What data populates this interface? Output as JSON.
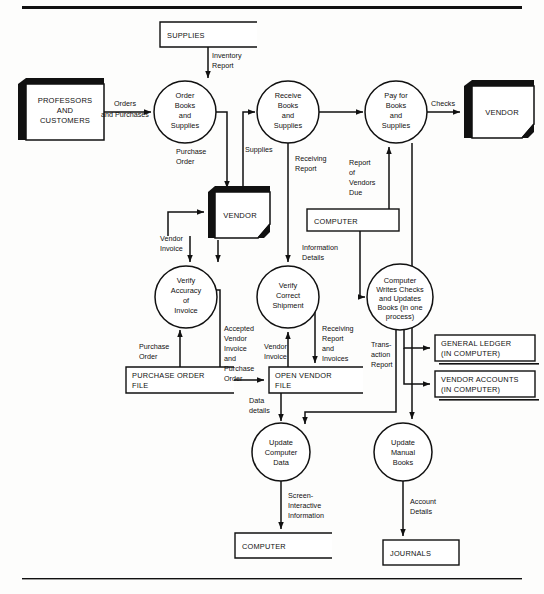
{
  "diagram": {
    "type": "data-flow-diagram",
    "colors": {
      "ink": "#111111",
      "paper": "#fdfdfc",
      "shadow": "#000000"
    },
    "rules": {
      "top": "horizontal-rule",
      "bottom": "horizontal-rule"
    },
    "entities": [
      {
        "id": "professors",
        "label_lines": [
          "PROFESSORS",
          "AND",
          "CUSTOMERS"
        ],
        "x": 18,
        "y": 84,
        "w": 78,
        "h": 56
      },
      {
        "id": "vendor_right",
        "label_lines": [
          "VENDOR"
        ],
        "x": 464,
        "y": 86,
        "w": 64,
        "h": 52
      },
      {
        "id": "vendor_mid",
        "label_lines": [
          "VENDOR"
        ],
        "x": 208,
        "y": 192,
        "w": 56,
        "h": 46
      }
    ],
    "processes": [
      {
        "id": "p1",
        "label_lines": [
          "Order",
          "Books",
          "and",
          "Supplies"
        ],
        "cx": 185,
        "cy": 112,
        "r": 31
      },
      {
        "id": "p2",
        "label_lines": [
          "Receive",
          "Books",
          "and",
          "Supplies"
        ],
        "cx": 288,
        "cy": 112,
        "r": 31
      },
      {
        "id": "p3",
        "label_lines": [
          "Pay for",
          "Books",
          "and",
          "Supplies"
        ],
        "cx": 396,
        "cy": 112,
        "r": 31
      },
      {
        "id": "p4",
        "label_lines": [
          "Verify",
          "Accuracy",
          "of",
          "Invoice"
        ],
        "cx": 186,
        "cy": 297,
        "r": 31
      },
      {
        "id": "p5",
        "label_lines": [
          "Verify",
          "Correct",
          "Shipment"
        ],
        "cx": 288,
        "cy": 297,
        "r": 31
      },
      {
        "id": "p6",
        "label_lines": [
          "Computer",
          "Writes Checks",
          "and Updates",
          "Books (in one",
          "process)"
        ],
        "cx": 400,
        "cy": 297,
        "r": 33
      },
      {
        "id": "p7",
        "label_lines": [
          "Update",
          "Computer",
          "Data"
        ],
        "cx": 281,
        "cy": 452,
        "r": 29
      },
      {
        "id": "p8",
        "label_lines": [
          "Update",
          "Manual",
          "Books"
        ],
        "cx": 403,
        "cy": 452,
        "r": 29
      }
    ],
    "stores": [
      {
        "id": "supplies",
        "label_lines": [
          "SUPPLIES"
        ],
        "x": 160,
        "y": 22,
        "w": 97,
        "h": 25,
        "open": true
      },
      {
        "id": "computer_mid",
        "label_lines": [
          "COMPUTER"
        ],
        "x": 307,
        "y": 209,
        "w": 92,
        "h": 22,
        "open": false
      },
      {
        "id": "po_file",
        "label_lines": [
          "PURCHASE ORDER",
          "FILE"
        ],
        "x": 126,
        "y": 367,
        "w": 108,
        "h": 26,
        "open": true
      },
      {
        "id": "open_vendor_file",
        "label_lines": [
          "OPEN VENDOR",
          "FILE"
        ],
        "x": 269,
        "y": 367,
        "w": 94,
        "h": 26,
        "open": true
      },
      {
        "id": "general_ledger",
        "label_lines": [
          "GENERAL   LEDGER",
          "(IN COMPUTER)"
        ],
        "x": 435,
        "y": 335,
        "w": 100,
        "h": 26,
        "open": false,
        "shadow": true
      },
      {
        "id": "vendor_accounts",
        "label_lines": [
          "VENDOR  ACCOUNTS",
          "(IN COMPUTER)"
        ],
        "x": 435,
        "y": 371,
        "w": 100,
        "h": 26,
        "open": false,
        "shadow": true
      },
      {
        "id": "computer_bottom",
        "label_lines": [
          "COMPUTER"
        ],
        "x": 235,
        "y": 533,
        "w": 97,
        "h": 25,
        "open": true
      },
      {
        "id": "journals",
        "label_lines": [
          "JOURNALS"
        ],
        "x": 383,
        "y": 540,
        "w": 76,
        "h": 25,
        "open": false
      }
    ],
    "flows": [
      {
        "id": "f1",
        "label_lines": [
          "Inventory",
          "Report"
        ],
        "x": 212,
        "y": 57,
        "anchor": "start"
      },
      {
        "id": "f2",
        "label_lines": [
          "Orders",
          "and Purchases"
        ],
        "x": 131,
        "y": 105,
        "anchor": "middle"
      },
      {
        "id": "f3",
        "label_lines": [
          "Purchase",
          "Order"
        ],
        "x": 196,
        "y": 155,
        "anchor": "start"
      },
      {
        "id": "f4",
        "label_lines": [
          "Supplies"
        ],
        "x": 243,
        "y": 150,
        "anchor": "start"
      },
      {
        "id": "f5",
        "label_lines": [
          "Receiving",
          "Report"
        ],
        "x": 296,
        "y": 160,
        "anchor": "start"
      },
      {
        "id": "f6",
        "label_lines": [
          "Report",
          "of",
          "Vendors",
          "Due"
        ],
        "x": 349,
        "y": 162,
        "anchor": "start"
      },
      {
        "id": "f7",
        "label_lines": [
          "Checks"
        ],
        "x": 437,
        "y": 106,
        "anchor": "middle"
      },
      {
        "id": "f8",
        "label_lines": [
          "Vendor",
          "Invoice"
        ],
        "x": 163,
        "y": 237,
        "anchor": "start"
      },
      {
        "id": "f9",
        "label_lines": [
          "Information",
          "Details"
        ],
        "x": 302,
        "y": 252,
        "anchor": "start"
      },
      {
        "id": "f10",
        "label_lines": [
          "Accepted",
          "Vendor",
          "Invoice",
          "and",
          "Purchase",
          "Order"
        ],
        "x": 224,
        "y": 330,
        "anchor": "start"
      },
      {
        "id": "f11",
        "label_lines": [
          "Purchase",
          "Order"
        ],
        "x": 141,
        "y": 348,
        "anchor": "start"
      },
      {
        "id": "f12",
        "label_lines": [
          "Vendor",
          "Invoice"
        ],
        "x": 271,
        "y": 345,
        "anchor": "start"
      },
      {
        "id": "f13",
        "label_lines": [
          "Receiving",
          "Report",
          "and",
          "Invoices"
        ],
        "x": 325,
        "y": 330,
        "anchor": "start"
      },
      {
        "id": "f14",
        "label_lines": [
          "Trans-",
          "action",
          "Report"
        ],
        "x": 374,
        "y": 346,
        "anchor": "start"
      },
      {
        "id": "f15",
        "label_lines": [
          "Data",
          "details"
        ],
        "x": 249,
        "y": 402,
        "anchor": "start"
      },
      {
        "id": "f16",
        "label_lines": [
          "Screen-",
          "Interactive",
          "Information"
        ],
        "x": 288,
        "y": 497,
        "anchor": "start"
      },
      {
        "id": "f17",
        "label_lines": [
          "Account",
          "Details"
        ],
        "x": 410,
        "y": 503,
        "anchor": "start"
      }
    ]
  }
}
